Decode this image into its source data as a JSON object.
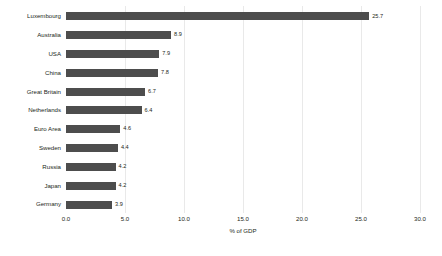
{
  "chart_data": {
    "type": "bar",
    "orientation": "horizontal",
    "title": "",
    "xlabel": "% of GDP",
    "ylabel": "",
    "xlim": [
      0.0,
      30.0
    ],
    "xticks": [
      "0.0",
      "5.0",
      "10.0",
      "15.0",
      "20.0",
      "25.0",
      "30.0"
    ],
    "xtick_values": [
      0.0,
      5.0,
      10.0,
      15.0,
      20.0,
      25.0,
      30.0
    ],
    "grid": true,
    "legend": false,
    "bar_color": "#4d4d4d",
    "grid_color": "#e9e9e9",
    "categories": [
      "Luxembourg",
      "Australia",
      "USA",
      "China",
      "Great Britain",
      "Netherlands",
      "Euro Area",
      "Sweden",
      "Russia",
      "Japan",
      "Germany"
    ],
    "values": [
      25.7,
      8.9,
      7.9,
      7.8,
      6.7,
      6.4,
      4.6,
      4.4,
      4.2,
      4.2,
      3.9
    ],
    "value_labels": [
      "25.7",
      "8.9",
      "7.9",
      "7.8",
      "6.7",
      "6.4",
      "4.6",
      "4.4",
      "4.2",
      "4.2",
      "3.9"
    ]
  }
}
